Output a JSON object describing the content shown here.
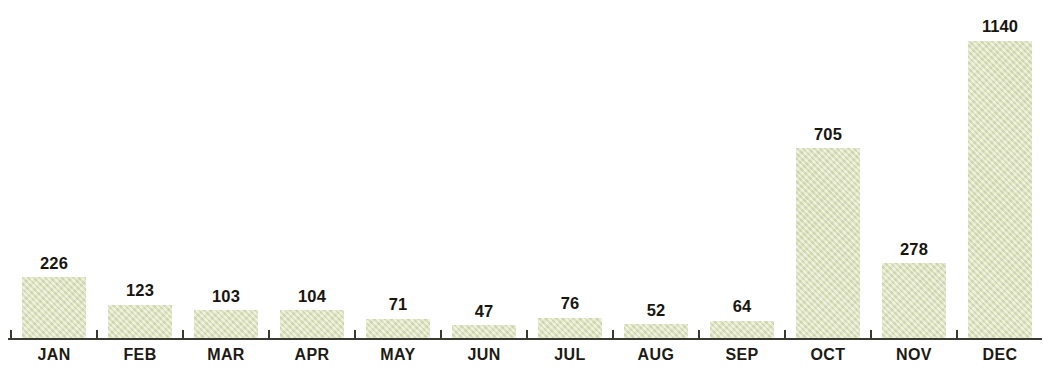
{
  "chart_data": {
    "type": "bar",
    "title": "",
    "subtitle": "",
    "xlabel": "",
    "ylabel": "",
    "categories": [
      "JAN",
      "FEB",
      "MAR",
      "APR",
      "MAY",
      "JUN",
      "JUL",
      "AUG",
      "SEP",
      "OCT",
      "NOV",
      "DEC"
    ],
    "values": [
      226,
      123,
      103,
      104,
      71,
      47,
      76,
      52,
      64,
      705,
      278,
      1140
    ],
    "data_labels": [
      "226",
      "123",
      "103",
      "104",
      "71",
      "47",
      "76",
      "52",
      "64",
      "705",
      "278",
      "1140"
    ],
    "ylim": [
      0,
      1140
    ],
    "grid": false,
    "legend": false,
    "legend_position": "none",
    "y_axis_visible": false,
    "x_axis_visible": true,
    "tick_marks": "between-categories",
    "bar_color": "#dde3bc",
    "axis_color": "#3a3a32",
    "label_color": "#1c1a13",
    "value_label_color": "#19160f",
    "background_color": "#ffffff"
  }
}
